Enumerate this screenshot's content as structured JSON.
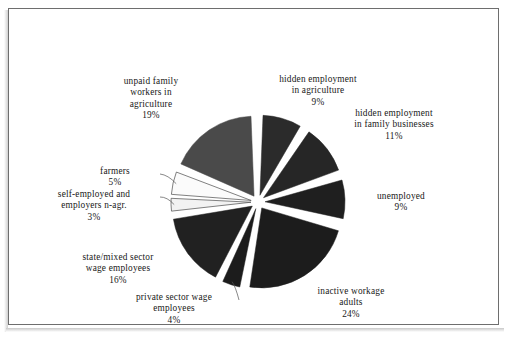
{
  "figure": {
    "border_color": "#6e6e6e",
    "background": "#ffffff"
  },
  "chart_data": {
    "type": "pie",
    "title": "",
    "subtitle": "",
    "xlabel": "",
    "ylabel": "",
    "legend_position": "none",
    "grid": false,
    "exploded": true,
    "units": "percent",
    "total": 100,
    "categories": [
      "hidden employment in agriculture",
      "hidden employment in family businesses",
      "unemployed",
      "inactive workage adults",
      "private sector wage employees",
      "state/mixed sector wage employees",
      "self-employed and employers n-agr.",
      "farmers",
      "unpaid family workers in agriculture"
    ],
    "values": [
      9,
      11,
      9,
      24,
      4,
      16,
      3,
      5,
      19
    ],
    "slices": [
      {
        "name": "hidden-employment-agriculture",
        "label_lines": "hidden employment\nin agriculture",
        "value": 9,
        "value_text": "9%",
        "color": "#2b2b2b",
        "label_x": 262,
        "label_y": 74,
        "label_width": 112,
        "leader": false
      },
      {
        "name": "hidden-employment-family-businesses",
        "label_lines": "hidden employment\nin family businesses",
        "value": 11,
        "value_text": "11%",
        "color": "#262626",
        "label_x": 333,
        "label_y": 108,
        "label_width": 122,
        "leader": false
      },
      {
        "name": "unemployed",
        "label_lines": "unemployed",
        "value": 9,
        "value_text": "9%",
        "color": "#1f1f1f",
        "label_x": 358,
        "label_y": 191,
        "label_width": 86,
        "leader": false
      },
      {
        "name": "inactive-workage-adults",
        "label_lines": "inactive workage\nadults",
        "value": 24,
        "value_text": "24%",
        "color": "#1c1c1c",
        "label_x": 298,
        "label_y": 286,
        "label_width": 106,
        "leader": false
      },
      {
        "name": "private-sector-wage-employees",
        "label_lines": "private sector wage\nemployees",
        "value": 4,
        "value_text": "4%",
        "color": "#1c1c1c",
        "label_x": 113,
        "label_y": 292,
        "label_width": 122,
        "leader": true
      },
      {
        "name": "state-mixed-sector-wage-employees",
        "label_lines": "state/mixed sector\nwage employees",
        "value": 16,
        "value_text": "16%",
        "color": "#212121",
        "label_x": 56,
        "label_y": 252,
        "label_width": 124,
        "leader": false
      },
      {
        "name": "self-employed-and-employers-nagr",
        "label_lines": "self-employed and\nemployers n-agr.",
        "value": 3,
        "value_text": "3%",
        "color": "#f2f2f2",
        "label_x": 32,
        "label_y": 189,
        "label_width": 124,
        "leader": true
      },
      {
        "name": "farmers",
        "label_lines": "farmers",
        "value": 5,
        "value_text": "5%",
        "color": "#fbfbfb",
        "label_x": 74,
        "label_y": 166,
        "label_width": 82,
        "leader": true
      },
      {
        "name": "unpaid-family-workers-agriculture",
        "label_lines": "unpaid family\nworkers in\nagriculture",
        "value": 19,
        "value_text": "19%",
        "color": "#4a4a4a",
        "label_x": 98,
        "label_y": 76,
        "label_width": 106,
        "leader": false
      }
    ]
  }
}
